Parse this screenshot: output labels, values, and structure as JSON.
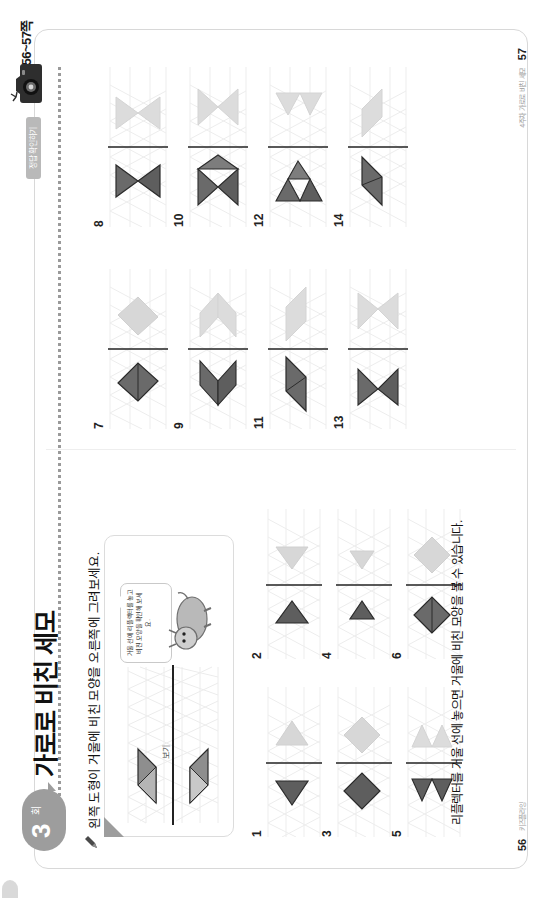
{
  "document": {
    "running_head": "본문 56~57쪽",
    "chapter": {
      "number": "3",
      "unit": "회",
      "title": "가로로 비친 세모"
    },
    "camera_tag": "정답 확인하기",
    "instruction": "왼쪽 도형이 거울에 비친 모양을 오른쪽에 그려보세요.",
    "example_label": "보기",
    "hint_text": "거울 선에 리플렉터를 놓고 비친 모양을 확인해 보세요.",
    "bottom_caption": "리플렉터를 거울 선에 놓으면 거울에 비친 모양을 볼 수 있습니다.",
    "page_left": "56",
    "page_right": "57",
    "page_note_left": "키즈플라잉",
    "page_note_right": "4주차 가로로 비친 세모"
  },
  "icons": {
    "camera": "camera-icon",
    "pencil": "pencil-icon",
    "mascot": "mascot-character-icon",
    "fold": "folded-corner-icon"
  },
  "colors": {
    "ink": "#111111",
    "grid": "#e8e8e8",
    "shape_dark": "#5e5e5e",
    "shape_mid": "#7d7d7d",
    "shape_light": "#cfcfcf",
    "badge": "#9d9d9d",
    "tag": "#b9b9b9",
    "frame": "#d8d8d8"
  },
  "problems": [
    {
      "n": "1",
      "page": "left",
      "x": 62,
      "y": 250,
      "shape": "tri-left",
      "dark": true
    },
    {
      "n": "2",
      "page": "left",
      "x": 240,
      "y": 250,
      "shape": "tri-right",
      "dark": true
    },
    {
      "n": "3",
      "page": "left",
      "x": 62,
      "y": 320,
      "shape": "rhombus",
      "dark": true
    },
    {
      "n": "4",
      "page": "left",
      "x": 240,
      "y": 320,
      "shape": "tri-right-sm",
      "dark": true
    },
    {
      "n": "5",
      "page": "left",
      "x": 62,
      "y": 390,
      "shape": "tri-pair",
      "dark": true
    },
    {
      "n": "6",
      "page": "left",
      "x": 240,
      "y": 390,
      "shape": "rhombus-split",
      "dark": true
    },
    {
      "n": "7",
      "page": "right",
      "x": 470,
      "y": 100,
      "shape": "rhombus-split",
      "dark": true
    },
    {
      "n": "8",
      "page": "right",
      "x": 672,
      "y": 100,
      "shape": "bowtie",
      "dark": true
    },
    {
      "n": "9",
      "page": "right",
      "x": 470,
      "y": 180,
      "shape": "rhombus-wide",
      "dark": true
    },
    {
      "n": "10",
      "page": "right",
      "x": 672,
      "y": 180,
      "shape": "bowtie-wide",
      "dark": true
    },
    {
      "n": "11",
      "page": "right",
      "x": 470,
      "y": 260,
      "shape": "para-long",
      "dark": true
    },
    {
      "n": "12",
      "page": "right",
      "x": 672,
      "y": 260,
      "shape": "tri-stack",
      "dark": true
    },
    {
      "n": "13",
      "page": "right",
      "x": 470,
      "y": 340,
      "shape": "chevron",
      "dark": true
    },
    {
      "n": "14",
      "page": "right",
      "x": 672,
      "y": 340,
      "shape": "rhombus-split",
      "dark": true
    }
  ]
}
